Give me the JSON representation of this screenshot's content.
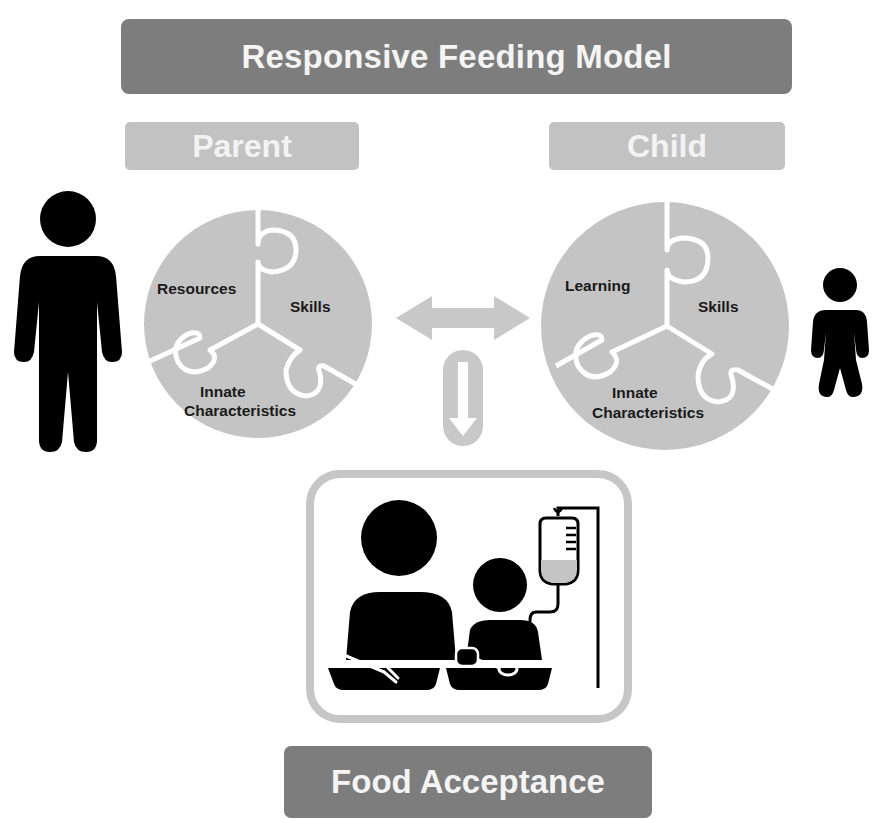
{
  "title": "Responsive Feeding Model",
  "parent": {
    "label": "Parent",
    "pieces": [
      "Resources",
      "Skills",
      "Innate",
      "Characteristics"
    ]
  },
  "child": {
    "label": "Child",
    "pieces": [
      "Learning",
      "Skills",
      "Innate",
      "Characteristics"
    ]
  },
  "outcome": {
    "label": "Food Acceptance"
  },
  "icons": {
    "adult": "adult-person-icon",
    "child": "child-person-icon",
    "bidirectional": "double-arrow-icon",
    "down": "down-arrow-icon",
    "scene": "family-mealtime-with-iv-icon"
  },
  "colors": {
    "title_bg": "#7d7d7d",
    "role_bg": "#c2c2c2",
    "puzzle_fill": "#c4c4c4",
    "arrow_fill": "#c8c8c8",
    "frame_stroke": "#c6c6c6",
    "figure": "#000000",
    "text_light": "#f4f4f4",
    "text_dark": "#1a1a1a"
  }
}
